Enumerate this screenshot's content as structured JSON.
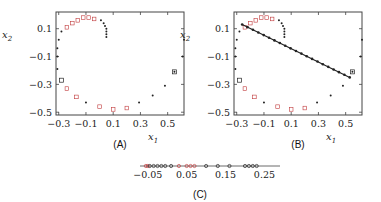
{
  "chart_data": [
    {
      "panel": "(A)",
      "type": "scatter",
      "xlabel": "x1",
      "ylabel": "x2",
      "xlim": [
        -0.32,
        0.62
      ],
      "ylim": [
        -0.52,
        0.22
      ],
      "xticks": [
        "-0.3",
        "-0.1",
        "0.1",
        "0.3",
        "0.5"
      ],
      "yticks": [
        "0.1",
        "-0.1",
        "-0.3",
        "-0.5"
      ],
      "grid": false,
      "series": [
        {
          "name": "black markers",
          "color": "#222222",
          "points": [
            [
              0.05,
              0.04
            ],
            [
              0.05,
              0.06
            ],
            [
              0.05,
              0.08
            ],
            [
              0.05,
              0.1
            ],
            [
              0.04,
              0.12
            ],
            [
              0.03,
              0.14
            ],
            [
              0.01,
              0.16
            ],
            [
              -0.28,
              0.08
            ],
            [
              -0.3,
              0.02
            ],
            [
              -0.31,
              -0.04
            ],
            [
              -0.31,
              -0.1
            ],
            [
              -0.31,
              -0.19
            ],
            [
              -0.1,
              -0.43
            ],
            [
              0.29,
              -0.43
            ],
            [
              0.39,
              -0.38
            ],
            [
              0.48,
              -0.31
            ],
            [
              0.55,
              -0.21
            ],
            [
              0.61,
              -0.1
            ],
            [
              0.62,
              0.02
            ]
          ]
        },
        {
          "name": "red markers",
          "color": "#c0393b",
          "points": [
            [
              -0.24,
              0.11
            ],
            [
              -0.2,
              0.14
            ],
            [
              -0.16,
              0.16
            ],
            [
              -0.12,
              0.18
            ],
            [
              -0.08,
              0.18
            ],
            [
              -0.04,
              0.17
            ],
            [
              -0.24,
              -0.33
            ],
            [
              -0.17,
              -0.39
            ],
            [
              0.0,
              -0.46
            ],
            [
              0.1,
              -0.48
            ],
            [
              0.2,
              -0.47
            ]
          ]
        },
        {
          "name": "black squares",
          "color": "#222222",
          "points": [
            [
              -0.28,
              -0.27
            ],
            [
              0.55,
              -0.21
            ]
          ]
        }
      ]
    },
    {
      "panel": "(B)",
      "type": "scatter",
      "xlabel": "x1",
      "ylabel": "x2",
      "xlim": [
        -0.32,
        0.62
      ],
      "ylim": [
        -0.52,
        0.22
      ],
      "xticks": [
        "-0.3",
        "-0.1",
        "0.1",
        "0.3",
        "0.5"
      ],
      "yticks": [
        "0.1",
        "-0.1",
        "-0.3",
        "-0.5"
      ],
      "grid": false,
      "annotation": "same spiral point set as (A), overlaid with a straight line from about (-0.26, 0.13) to (0.53, -0.25) on which the points are projected",
      "line": {
        "from": [
          -0.26,
          0.13
        ],
        "to": [
          0.53,
          -0.25
        ],
        "color": "#222222"
      }
    },
    {
      "panel": "(C)",
      "type": "scatter",
      "xlabel": "",
      "xlim": [
        -0.07,
        0.29
      ],
      "xticks": [
        "-0.05",
        "0.05",
        "0.15",
        "0.25"
      ],
      "annotation": "1D projection of the points onto the line from (B)",
      "points_x": [
        -0.055,
        -0.05,
        -0.045,
        -0.035,
        -0.025,
        -0.015,
        -0.005,
        0.01,
        0.03,
        0.05,
        0.06,
        0.07,
        0.1,
        0.13,
        0.16,
        0.2,
        0.21,
        0.22,
        0.23
      ]
    }
  ],
  "labels": {
    "panel_a": "(A)",
    "panel_b": "(B)",
    "panel_c": "(C)",
    "x1": "x",
    "x1_sub": "1",
    "x2": "x",
    "x2_sub": "2"
  }
}
